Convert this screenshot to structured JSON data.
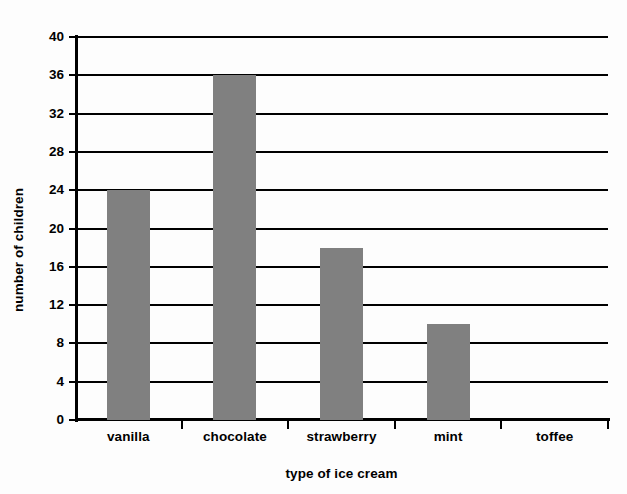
{
  "chart_data": {
    "type": "bar",
    "title": "",
    "xlabel": "type of ice cream",
    "ylabel": "number of children",
    "categories": [
      "vanilla",
      "chocolate",
      "strawberry",
      "mint",
      "toffee"
    ],
    "values": [
      24,
      36,
      18,
      10,
      0
    ],
    "ylim": [
      0,
      40
    ],
    "ytick_labels": [
      "0",
      "4",
      "8",
      "12",
      "16",
      "20",
      "24",
      "28",
      "32",
      "36",
      "40"
    ],
    "ytick_values": [
      0,
      4,
      8,
      12,
      16,
      20,
      24,
      28,
      32,
      36,
      40
    ],
    "grid": "horizontal",
    "legend": "none",
    "bar_color": "#808080",
    "axis_color": "#000000"
  }
}
